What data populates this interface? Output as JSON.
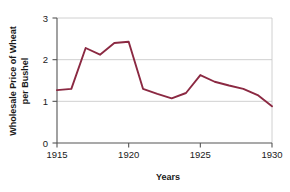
{
  "chart_data": {
    "type": "line",
    "title": "",
    "xlabel": "Years",
    "ylabel_lines": [
      "Wholesale Price of Wheat",
      "per Bushel"
    ],
    "ylabel": "Wholesale Price of Wheat per Bushel",
    "x": [
      1915,
      1916,
      1917,
      1918,
      1919,
      1920,
      1921,
      1922,
      1923,
      1924,
      1925,
      1926,
      1927,
      1928,
      1929,
      1930
    ],
    "values": [
      1.27,
      1.3,
      2.28,
      2.12,
      2.4,
      2.43,
      1.3,
      1.18,
      1.07,
      1.2,
      1.63,
      1.47,
      1.38,
      1.3,
      1.15,
      0.88
    ],
    "series": [
      {
        "name": "Wholesale Price of Wheat per Bushel",
        "values": [
          1.27,
          1.3,
          2.28,
          2.12,
          2.4,
          2.43,
          1.3,
          1.18,
          1.07,
          1.2,
          1.63,
          1.47,
          1.38,
          1.3,
          1.15,
          0.88
        ]
      }
    ],
    "xlim": [
      1915,
      1930
    ],
    "ylim": [
      0,
      3
    ],
    "xticks": [
      1915,
      1920,
      1925,
      1930
    ],
    "xtick_labels": [
      "1915",
      "1920",
      "1925",
      "1930"
    ],
    "yticks": [
      0,
      1,
      2,
      3
    ],
    "ytick_labels": [
      "0",
      "1",
      "2",
      "3"
    ],
    "grid": true,
    "gridlines_y": [
      1,
      2,
      3
    ],
    "legend": "none",
    "line_color": "#8B2942",
    "grid_color": "#c8c8c8",
    "axis_color": "#555555",
    "background": "#ffffff"
  },
  "axes": {
    "x_tick_labels": [
      "1915",
      "1920",
      "1925",
      "1930"
    ],
    "y_tick_labels": [
      "0",
      "1",
      "2",
      "3"
    ],
    "x_title": "Years",
    "y_title_line1": "Wholesale Price of Wheat",
    "y_title_line2": "per Bushel"
  }
}
